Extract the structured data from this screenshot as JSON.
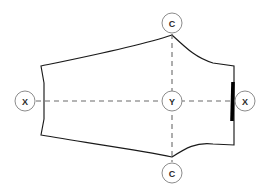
{
  "diagram": {
    "type": "engineering-section-outline",
    "canvas": {
      "width": 269,
      "height": 194,
      "background": "#ffffff"
    },
    "colors": {
      "outline": "#1a1a1a",
      "axis": "#6b6b6b",
      "marker_stroke": "#8c8c8c",
      "marker_fill": "#ffffff",
      "thick_edge": "#000000",
      "label_text": "#2b2b2b"
    },
    "markers": [
      {
        "id": "marker-top",
        "label": "C",
        "cx": 172,
        "cy": 23,
        "r": 10
      },
      {
        "id": "marker-left",
        "label": "X",
        "cx": 25,
        "cy": 101,
        "r": 10
      },
      {
        "id": "marker-center",
        "label": "Y",
        "cx": 172,
        "cy": 101,
        "r": 10
      },
      {
        "id": "marker-right",
        "label": "X",
        "cx": 245,
        "cy": 101,
        "r": 10
      },
      {
        "id": "marker-bottom",
        "label": "C",
        "cx": 172,
        "cy": 173,
        "r": 10
      }
    ],
    "axes": {
      "horizontal": {
        "x1": 36,
        "y1": 101,
        "x2": 234,
        "y2": 101
      },
      "vertical": {
        "x1": 172,
        "y1": 34,
        "x2": 172,
        "y2": 162
      }
    },
    "outline": {
      "path": "M 41 66 C 80 58 140 46 172 35 C 186 48 196 58 213 63 L 234 66 L 234 145 L 213 144 C 196 142 186 148 172 157 C 140 150 80 142 41 135 L 44 119 L 44 83 Z",
      "vertices": {
        "top_left_corner": [
          41,
          66
        ],
        "top_peak": [
          172,
          35
        ],
        "top_right_corner": [
          234,
          66
        ],
        "bottom_right_corner": [
          234,
          145
        ],
        "bottom_vertex": [
          172,
          157
        ],
        "bottom_left_corner": [
          41,
          135
        ],
        "left_waist_lower": [
          44,
          119
        ],
        "left_waist_upper": [
          44,
          83
        ]
      }
    },
    "thick_edge": {
      "x1": 233,
      "y1": 82,
      "x2": 232,
      "y2": 121
    }
  }
}
